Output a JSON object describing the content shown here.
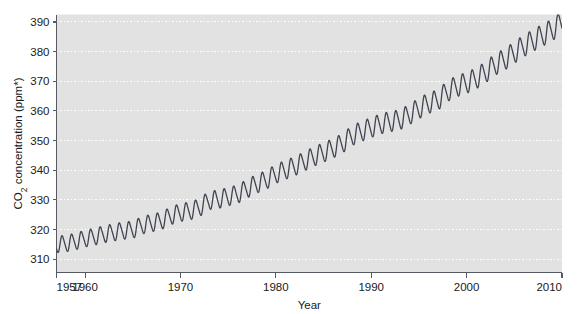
{
  "chart_data": {
    "type": "line",
    "title": "",
    "subtitle": "",
    "xlabel": "Year",
    "ylabel": "CO₂ concentration (ppm*)",
    "xlim": [
      1957,
      2010
    ],
    "ylim": [
      305.5,
      392.5
    ],
    "grid": true,
    "grid_axis": "y",
    "legend": "none",
    "xticks": [
      1957,
      1960,
      1970,
      1980,
      1990,
      2000,
      2010
    ],
    "xtick_labels": [
      "1957",
      "1960",
      "1970",
      "1980",
      "1990",
      "2000",
      "2010"
    ],
    "yticks": [
      310,
      320,
      330,
      340,
      350,
      360,
      370,
      380,
      390
    ],
    "ytick_labels": [
      "310",
      "320",
      "330",
      "340",
      "350",
      "360",
      "370",
      "380",
      "390"
    ],
    "series": [
      {
        "name": "Mauna Loa CO2 monthly mean",
        "description": "Keeling Curve: annual seasonal oscillation of about 6 ppm peak-to-peak superimposed on an accelerating rising trend",
        "annual_mean_x": [
          1957,
          1958,
          1959,
          1960,
          1961,
          1962,
          1963,
          1964,
          1965,
          1966,
          1967,
          1968,
          1969,
          1970,
          1971,
          1972,
          1973,
          1974,
          1975,
          1976,
          1977,
          1978,
          1979,
          1980,
          1981,
          1982,
          1983,
          1984,
          1985,
          1986,
          1987,
          1988,
          1989,
          1990,
          1991,
          1992,
          1993,
          1994,
          1995,
          1996,
          1997,
          1998,
          1999,
          2000,
          2001,
          2002,
          2003,
          2004,
          2005,
          2006,
          2007,
          2008,
          2009,
          2010
        ],
        "annual_mean_y": [
          315.0,
          315.3,
          316.0,
          316.9,
          317.6,
          318.4,
          319.0,
          319.6,
          320.0,
          321.4,
          322.2,
          323.0,
          324.6,
          325.7,
          326.3,
          327.5,
          329.7,
          330.2,
          331.1,
          332.0,
          333.8,
          335.4,
          336.8,
          338.7,
          340.1,
          341.4,
          343.0,
          344.6,
          346.0,
          347.4,
          349.2,
          351.6,
          353.1,
          354.4,
          355.6,
          356.4,
          357.1,
          358.8,
          360.8,
          362.6,
          363.8,
          366.6,
          368.3,
          369.5,
          371.0,
          373.1,
          375.6,
          377.4,
          379.7,
          381.9,
          383.8,
          385.6,
          387.4,
          389.9
        ],
        "seasonal_amplitude_ppm": 6.0,
        "start_value": 315.0,
        "end_value": 389.9,
        "color": "#3f4450",
        "line_width": 1.3
      }
    ],
    "colors": {
      "plot_background": "#e2e2e2",
      "grid_line": "#ffffff",
      "axis_line": "#555a63",
      "curve": "#3f4450",
      "text": "#1a1a1a",
      "page_background": "#ffffff"
    }
  }
}
